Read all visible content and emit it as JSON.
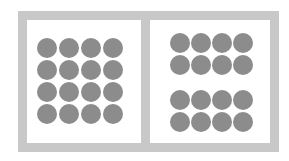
{
  "diagram": {
    "colors": {
      "frame": "#c8c8c8",
      "panel": "#ffffff",
      "dot": "#8c8c8c"
    },
    "left_panel": {
      "arrangement": "4x4 evenly spaced grid",
      "rows": 4,
      "cols": 4,
      "col_centers": [
        47,
        69,
        91,
        113
      ],
      "row_centers": [
        48,
        70,
        92,
        114
      ]
    },
    "right_panel": {
      "arrangement": "two groups of 2x4 separated by a gap",
      "rows": 4,
      "cols": 4,
      "col_centers": [
        180,
        201,
        222,
        243
      ],
      "row_centers": [
        43,
        65,
        100,
        122
      ]
    }
  }
}
